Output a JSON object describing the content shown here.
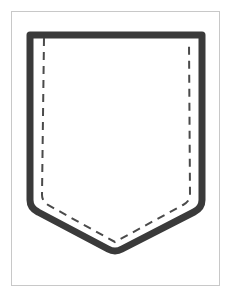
{
  "diagram": {
    "shapes": [
      {
        "name": "pocket-outline",
        "style": "solid",
        "color": "#3a3a3a"
      },
      {
        "name": "stitch-line",
        "style": "dashed",
        "color": "#4a4a4a"
      }
    ],
    "frame_color": "#c8c8c8",
    "background": "#ffffff"
  }
}
